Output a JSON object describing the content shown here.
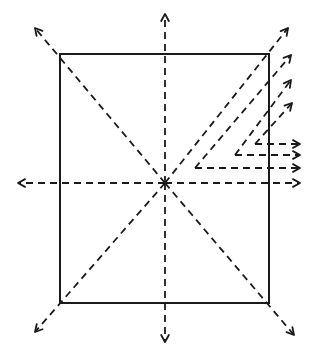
{
  "diagram": {
    "colors": {
      "ink": "#1a1a1a",
      "background": "#ffffff"
    },
    "rectangle": {
      "x": 60,
      "y": 54,
      "width": 209,
      "height": 249
    },
    "center": {
      "x": 165,
      "y": 183
    },
    "radial_arrows": [
      {
        "name": "up",
        "from": [
          165,
          183
        ],
        "to": [
          165,
          14
        ]
      },
      {
        "name": "down",
        "from": [
          165,
          183
        ],
        "to": [
          165,
          342
        ]
      },
      {
        "name": "left",
        "from": [
          165,
          183
        ],
        "to": [
          18,
          183
        ]
      },
      {
        "name": "right",
        "from": [
          165,
          183
        ],
        "to": [
          300,
          183
        ]
      },
      {
        "name": "up-left",
        "from": [
          165,
          183
        ],
        "to": [
          35,
          28
        ]
      },
      {
        "name": "down-right",
        "from": [
          165,
          183
        ],
        "to": [
          294,
          335
        ]
      },
      {
        "name": "down-left",
        "from": [
          165,
          183
        ],
        "to": [
          35,
          332
        ]
      },
      {
        "name": "up-right",
        "from": [
          165,
          183
        ],
        "to": [
          288,
          28
        ]
      }
    ],
    "parallel_diagonals": [
      {
        "from": [
          195,
          168
        ],
        "to": [
          291,
          55
        ]
      },
      {
        "from": [
          235,
          155
        ],
        "to": [
          291,
          80
        ]
      },
      {
        "from": [
          255,
          144
        ],
        "to": [
          292,
          103
        ]
      }
    ],
    "horizontal_arrows": [
      {
        "from": [
          255,
          144
        ],
        "to": [
          300,
          144
        ]
      },
      {
        "from": [
          235,
          155
        ],
        "to": [
          300,
          155
        ]
      },
      {
        "from": [
          195,
          168
        ],
        "to": [
          300,
          168
        ]
      }
    ]
  }
}
